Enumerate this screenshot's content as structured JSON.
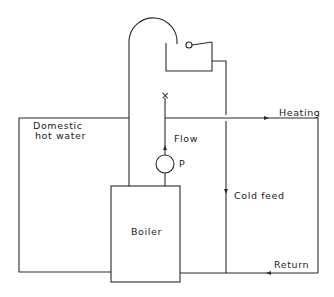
{
  "diagram": {
    "labels": {
      "domestic_line1": "Domestic",
      "domestic_line2": "hot water",
      "heating": "Heating",
      "flow": "Flow",
      "pump": "P",
      "cold_feed": "Cold feed",
      "boiler": "Boiler",
      "return": "Return",
      "vent_mark": "×"
    },
    "colors": {
      "line": "#2a2a2a",
      "background": "#ffffff"
    }
  }
}
